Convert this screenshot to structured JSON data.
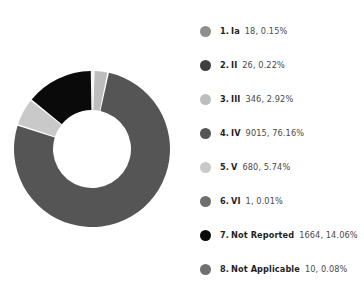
{
  "chart_data": {
    "type": "pie",
    "variant": "donut",
    "title": "",
    "subtitle": "",
    "xlabel": "",
    "ylabel": "",
    "legend_position": "right",
    "grid": false,
    "total": 11760,
    "categories": [
      "Ia",
      "II",
      "III",
      "IV",
      "V",
      "VI",
      "Not Reported",
      "Not Applicable"
    ],
    "values": [
      18,
      26,
      346,
      9015,
      680,
      1,
      1664,
      10
    ],
    "percentages": [
      0.15,
      0.22,
      2.92,
      76.16,
      5.74,
      0.01,
      14.06,
      0.08
    ],
    "colors": [
      "#8f8f8f",
      "#3f3f3f",
      "#bdbdbd",
      "#555555",
      "#c9c9c9",
      "#6e6e6e",
      "#0a0a0a",
      "#707070"
    ],
    "slice_gap_degrees": 1.2,
    "start_angle_degrees": -90
  },
  "legend": {
    "items": [
      {
        "index": "1.",
        "label": "Ia",
        "value": "18, 0.15%",
        "color": "#8f8f8f"
      },
      {
        "index": "2.",
        "label": "II",
        "value": "26, 0.22%",
        "color": "#3f3f3f"
      },
      {
        "index": "3.",
        "label": "III",
        "value": "346, 2.92%",
        "color": "#bdbdbd"
      },
      {
        "index": "4.",
        "label": "IV",
        "value": "9015, 76.16%",
        "color": "#555555"
      },
      {
        "index": "5.",
        "label": "V",
        "value": "680, 5.74%",
        "color": "#c9c9c9"
      },
      {
        "index": "6.",
        "label": "VI",
        "value": "1, 0.01%",
        "color": "#6e6e6e"
      },
      {
        "index": "7.",
        "label": "Not Reported",
        "value": "1664, 14.06%",
        "color": "#0a0a0a"
      },
      {
        "index": "8.",
        "label": "Not Applicable",
        "value": "10, 0.08%",
        "color": "#707070"
      }
    ]
  },
  "colors": {
    "background": "#ffffff",
    "text": "#1f1f1f",
    "text_secondary": "#4a4a4a"
  }
}
